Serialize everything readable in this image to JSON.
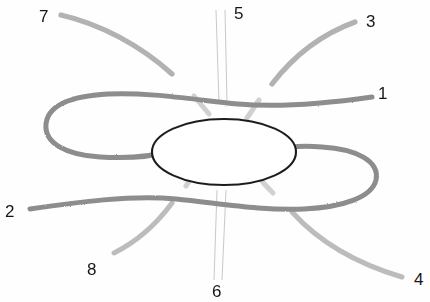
{
  "figure": {
    "style": "pencil sketch on white paper",
    "width": 430,
    "height": 302,
    "background_color": "#fefefe",
    "colors": {
      "ellipse_stroke": "#1d1d1d",
      "main_curve_stroke": "#8d8d8d",
      "diagonal_stroke": "#b3b3b3",
      "thin_line_stroke": "#b8b8b8",
      "label_text": "#161616"
    }
  },
  "labels": [
    {
      "id": "label-1",
      "text": "1",
      "x": 378,
      "y": 85
    },
    {
      "id": "label-2",
      "text": "2",
      "x": 5,
      "y": 203
    },
    {
      "id": "label-3",
      "text": "3",
      "x": 366,
      "y": 13
    },
    {
      "id": "label-4",
      "text": "4",
      "x": 414,
      "y": 271
    },
    {
      "id": "label-5",
      "text": "5",
      "x": 234,
      "y": 5
    },
    {
      "id": "label-6",
      "text": "6",
      "x": 212,
      "y": 283
    },
    {
      "id": "label-7",
      "text": "7",
      "x": 39,
      "y": 8
    },
    {
      "id": "label-8",
      "text": "8",
      "x": 87,
      "y": 261
    }
  ],
  "shapes": {
    "central_ellipse": {
      "name": "central-ellipse",
      "cx": 224,
      "cy": 152,
      "rx": 72,
      "ry": 33,
      "stroke_width": 2.1
    },
    "upper_main_curve": {
      "name": "upper-main-curve",
      "description": "long curve entering at right near label 1, sweeping left and looping back at far left",
      "path": "M 372,97 C 330,103 282,108 238,104 C 196,100 150,92 108,94 C 72,96 48,106 46,124 C 44,143 66,155 100,157 C 130,159 152,156 168,152"
    },
    "lower_main_curve": {
      "name": "lower-main-curve",
      "description": "long curve entering at left near label 2, sweeping right and looping back at far right",
      "path": "M 30,209 C 78,202 130,195 176,199 C 218,203 262,211 304,209 C 344,207 372,197 376,180 C 380,161 356,149 322,147 C 294,145 272,148 282,152"
    },
    "diagonal_upper_left": {
      "name": "diagonal-stroke-7",
      "path": "M 61,15 C 100,24 140,45 172,74",
      "stub_path": "M 193,95 C 198,101 203,107 208,113"
    },
    "diagonal_upper_right": {
      "name": "diagonal-stroke-3",
      "path": "M 355,22 C 322,34 295,54 272,84",
      "stub_path": "M 258,101 C 254,107 250,113 246,119"
    },
    "diagonal_lower_left": {
      "name": "diagonal-stroke-8",
      "path": "M 114,253 C 140,240 158,222 172,203",
      "stub_path": "M 186,185 C 190,179 194,173 198,168"
    },
    "diagonal_lower_right": {
      "name": "diagonal-stroke-4",
      "path": "M 402,277 C 358,264 320,243 292,212",
      "stub_path": "M 272,192 C 266,186 261,181 256,176"
    },
    "thin_lines_top": {
      "name": "thin-vertical-lines-5",
      "lines": [
        {
          "x1": 216,
          "y1": 10,
          "x2": 219,
          "y2": 103
        },
        {
          "x1": 225,
          "y1": 10,
          "x2": 227,
          "y2": 103
        }
      ]
    },
    "thin_lines_bottom": {
      "name": "thin-vertical-lines-6",
      "lines": [
        {
          "x1": 217,
          "y1": 190,
          "x2": 214,
          "y2": 280
        },
        {
          "x1": 226,
          "y1": 190,
          "x2": 222,
          "y2": 280
        }
      ]
    }
  }
}
